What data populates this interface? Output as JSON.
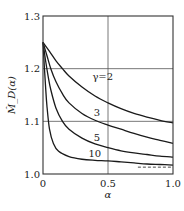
{
  "chart_data": {
    "type": "line",
    "title": "",
    "xlabel": "α",
    "ylabel": "M̂_D(α)",
    "xlim": [
      0,
      1.0
    ],
    "ylim": [
      1.0,
      1.3
    ],
    "xticks": [
      0,
      0.5,
      1.0
    ],
    "xtick_labels": [
      "0",
      "0.5",
      "1.0"
    ],
    "yticks": [
      1.0,
      1.1,
      1.2,
      1.3
    ],
    "ytick_labels": [
      "1.0",
      "1.1",
      "1.2",
      "1.3"
    ],
    "grid": true,
    "series": [
      {
        "name": "γ=2",
        "label": "γ=2",
        "x": [
          0,
          0.05,
          0.1,
          0.15,
          0.2,
          0.3,
          0.4,
          0.5,
          0.6,
          0.7,
          0.8,
          0.9,
          1.0
        ],
        "y": [
          1.25,
          1.233,
          1.215,
          1.2,
          1.186,
          1.165,
          1.148,
          1.135,
          1.124,
          1.115,
          1.108,
          1.102,
          1.097
        ]
      },
      {
        "name": "γ=3",
        "label": "3",
        "x": [
          0,
          0.03,
          0.06,
          0.1,
          0.15,
          0.2,
          0.3,
          0.4,
          0.5,
          0.6,
          0.7,
          0.8,
          0.9,
          1.0
        ],
        "y": [
          1.25,
          1.225,
          1.2,
          1.175,
          1.152,
          1.135,
          1.115,
          1.102,
          1.093,
          1.085,
          1.077,
          1.07,
          1.064,
          1.058
        ]
      },
      {
        "name": "γ=5",
        "label": "5",
        "x": [
          0,
          0.02,
          0.04,
          0.06,
          0.1,
          0.15,
          0.2,
          0.3,
          0.4,
          0.5,
          0.6,
          0.7,
          0.8,
          0.9,
          1.0
        ],
        "y": [
          1.25,
          1.215,
          1.185,
          1.16,
          1.125,
          1.1,
          1.085,
          1.068,
          1.057,
          1.05,
          1.044,
          1.04,
          1.037,
          1.034,
          1.032
        ]
      },
      {
        "name": "γ=10",
        "label": "10",
        "x": [
          0,
          0.01,
          0.02,
          0.03,
          0.05,
          0.08,
          0.12,
          0.2,
          0.3,
          0.4,
          0.5,
          0.6,
          0.7,
          0.8,
          0.9,
          1.0
        ],
        "y": [
          1.25,
          1.205,
          1.165,
          1.13,
          1.085,
          1.058,
          1.043,
          1.033,
          1.028,
          1.026,
          1.025,
          1.023,
          1.021,
          1.019,
          1.018,
          1.017
        ]
      }
    ],
    "asymptote": {
      "style": "dashed",
      "x": [
        0.73,
        1.0
      ],
      "y": 1.013
    },
    "annotations": [
      {
        "text": "γ=2",
        "x": 0.38,
        "y": 1.178
      },
      {
        "text": "3",
        "x": 0.39,
        "y": 1.111
      },
      {
        "text": "5",
        "x": 0.39,
        "y": 1.062
      },
      {
        "text": "10",
        "x": 0.35,
        "y": 1.033
      }
    ]
  }
}
